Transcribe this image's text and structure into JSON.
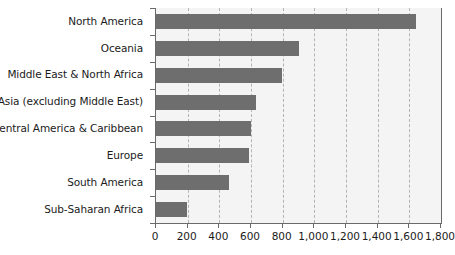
{
  "chart_data": {
    "type": "bar",
    "orientation": "horizontal",
    "title": "",
    "subtitle": "",
    "xlabel": "",
    "ylabel": "",
    "xlim": [
      0,
      1800
    ],
    "xtick_step": 200,
    "grid": true,
    "grid_axis": "x",
    "grid_style": "dashed",
    "legend": false,
    "legend_position": "none",
    "bar_color": "#6e6e6e",
    "plot_background": "#f4f4f4",
    "axis_color": "#6a6a6a",
    "gridline_color": "#b4b4b4",
    "text_color": "#1b1b1b",
    "categories": [
      "North America",
      "Oceania",
      "Middle East & North Africa",
      "Asia (excluding Middle East)",
      "Central America & Caribbean",
      "Europe",
      "South America",
      "Sub-Saharan Africa"
    ],
    "values": [
      1640,
      900,
      795,
      630,
      600,
      585,
      460,
      195
    ],
    "tick_labels": [
      "0",
      "200",
      "400",
      "600",
      "800",
      "1,000",
      "1,200",
      "1,400",
      "1,600",
      "1,800"
    ],
    "tick_values": [
      0,
      200,
      400,
      600,
      800,
      1000,
      1200,
      1400,
      1600,
      1800
    ]
  }
}
